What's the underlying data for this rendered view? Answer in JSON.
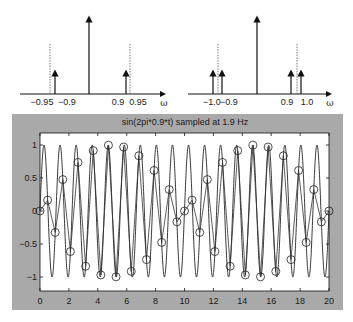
{
  "spectra": [
    {
      "name": "spectrum-left",
      "axis_label": "ω",
      "tick_labels": [
        {
          "text": "−0.95",
          "x": 42
        },
        {
          "text": "−0.9",
          "x": 67
        },
        {
          "text": "0.9",
          "x": 118
        },
        {
          "text": "0.95",
          "x": 138
        }
      ],
      "center_x": 89,
      "dotted_x": [
        50,
        130
      ],
      "small_arrows_x": [
        55,
        126
      ]
    },
    {
      "name": "spectrum-right",
      "axis_label": "ω",
      "tick_labels": [
        {
          "text": "−1.0",
          "x": 212
        },
        {
          "text": "−0.9",
          "x": 229
        },
        {
          "text": "0.9",
          "x": 287
        },
        {
          "text": "1.0",
          "x": 307
        }
      ],
      "center_x": 257,
      "dotted_x": [
        218,
        297
      ],
      "small_arrows_x": [
        213,
        222,
        291,
        301
      ]
    }
  ],
  "chart_data": {
    "type": "line",
    "title": "sin(2pi*0.9*t) sampled at 1.9 Hz",
    "xlabel": "",
    "ylabel": "",
    "xlim": [
      0,
      20
    ],
    "ylim": [
      -1.1,
      1.1
    ],
    "x_ticks": [
      0,
      2,
      4,
      6,
      8,
      10,
      12,
      14,
      16,
      18,
      20
    ],
    "y_ticks": [
      1,
      0.5,
      0,
      -0.5,
      -1
    ],
    "y_tick_labels": [
      "1",
      "0.5",
      "0",
      "−0.5",
      "−1"
    ],
    "grid": false,
    "series": [
      {
        "name": "continuous sin(2pi*0.9*t)",
        "frequency_hz": 0.9,
        "style": "solid line"
      },
      {
        "name": "samples at 1.9 Hz",
        "style": "line with circle markers",
        "x": [
          0,
          0.526,
          1.053,
          1.579,
          2.105,
          2.632,
          3.158,
          3.684,
          4.211,
          4.737,
          5.263,
          5.789,
          6.316,
          6.842,
          7.368,
          7.895,
          8.421,
          8.947,
          9.474,
          10.0,
          10.526,
          11.053,
          11.579,
          12.105,
          12.632,
          13.158,
          13.684,
          14.211,
          14.737,
          15.263,
          15.789,
          16.316,
          16.842,
          17.368,
          17.895,
          18.421,
          18.947,
          19.474,
          20.0
        ],
        "values": [
          0,
          0.164,
          -0.325,
          0.476,
          -0.614,
          0.736,
          -0.837,
          0.915,
          -0.969,
          0.997,
          -0.997,
          0.969,
          -0.915,
          0.837,
          -0.736,
          0.614,
          -0.476,
          0.325,
          -0.164,
          0,
          0.164,
          -0.325,
          0.476,
          -0.614,
          0.736,
          -0.837,
          0.915,
          -0.969,
          0.997,
          -0.997,
          0.969,
          -0.915,
          0.837,
          -0.736,
          0.614,
          -0.476,
          0.325,
          -0.164,
          0
        ]
      }
    ]
  }
}
